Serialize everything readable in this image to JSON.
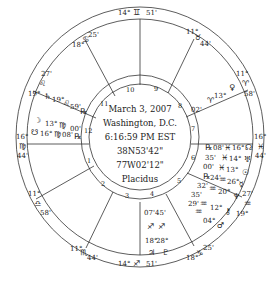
{
  "center_info": {
    "date": "March 3, 2007",
    "place": "Washington, D.C.",
    "time": "6:16:59 PM EST",
    "latitude": "38N53'42\"",
    "longitude": "77W02'12\"",
    "house_system": "Placidus"
  },
  "house_numbers": [
    "1",
    "2",
    "3",
    "4",
    "5",
    "6",
    "7",
    "8",
    "9",
    "10",
    "11",
    "12"
  ],
  "cusps": {
    "c1": {
      "deg": "16°",
      "sign": "♍",
      "min": "44'"
    },
    "c2": {
      "deg": "11°",
      "sign": "♎",
      "min": "58'"
    },
    "c3": {
      "deg": "11°",
      "sign": "♏",
      "min": "44'"
    },
    "c4": {
      "deg": "14°",
      "sign": "♐",
      "min": "51'"
    },
    "c5": {
      "deg": "18°",
      "sign": "♑",
      "min": "25'"
    },
    "c6": {
      "deg": "19°",
      "sign": "♒",
      "min": "27'"
    },
    "c7": {
      "deg": "16°",
      "sign": "♓",
      "min": "44'"
    },
    "c8": {
      "deg": "11°",
      "sign": "♈",
      "min": "58'"
    },
    "c9": {
      "deg": "11°",
      "sign": "♉",
      "min": "44'"
    },
    "c10": {
      "deg": "14°",
      "sign": "♊",
      "min": "51'"
    },
    "c11": {
      "deg": "18°",
      "sign": "♋",
      "min": "25'"
    },
    "c12": {
      "deg": "19°",
      "sign": "♌",
      "min": "27'"
    }
  },
  "planets": {
    "saturn": {
      "glyph": "♄",
      "deg": "19°",
      "sign": "♌",
      "min": "59'",
      "retro": "℞"
    },
    "moon": {
      "glyph": "☽",
      "deg": "13°",
      "sign": "♍",
      "min": "00'",
      "retro": ""
    },
    "south_node": {
      "glyph": "☋",
      "deg": "16°",
      "sign": "♍",
      "min": "08'",
      "retro": "℞"
    },
    "venus": {
      "glyph": "♀",
      "deg": "13°",
      "sign": "♈",
      "min": "02'",
      "retro": ""
    },
    "jupiter": {
      "glyph": "♃",
      "deg": "18°",
      "sign": "♐",
      "min": "07'",
      "retro": ""
    },
    "pluto": {
      "glyph": "♇",
      "deg": "28°",
      "sign": "♐",
      "min": "45'",
      "retro": ""
    },
    "north_node": {
      "glyph": "☊",
      "deg": "16°",
      "sign": "♓",
      "min": "08'",
      "retro": "℞"
    },
    "uranus": {
      "glyph": "♅",
      "deg": "14°",
      "sign": "♓",
      "min": "35'",
      "retro": ""
    },
    "sun": {
      "glyph": "☉",
      "deg": "13°",
      "sign": "♓",
      "min": "00'",
      "retro": ""
    },
    "mercury": {
      "glyph": "☿",
      "deg": "26°",
      "sign": "♒",
      "min": "24'",
      "retro": "℞"
    },
    "neptune": {
      "glyph": "♆",
      "deg": "20°",
      "sign": "♒",
      "min": "32'",
      "retro": ""
    },
    "chiron": {
      "glyph": "⚷",
      "deg": "12°",
      "sign": "♒",
      "min": "35'",
      "retro": ""
    },
    "mars": {
      "glyph": "♂",
      "deg": "04°",
      "sign": "♒",
      "min": "29'",
      "retro": ""
    }
  }
}
